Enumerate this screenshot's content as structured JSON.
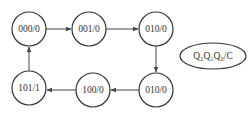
{
  "diagram": {
    "type": "state-transition",
    "states": [
      {
        "id": "s0",
        "label": "000/0",
        "cx": 29,
        "cy": 29
      },
      {
        "id": "s1",
        "label": "001/0",
        "cx": 89,
        "cy": 29
      },
      {
        "id": "s2",
        "label": "010/0",
        "cx": 156,
        "cy": 29
      },
      {
        "id": "s3",
        "label": "010/0",
        "cx": 156,
        "cy": 90
      },
      {
        "id": "s4",
        "label": "100/0",
        "cx": 93,
        "cy": 90
      },
      {
        "id": "s5",
        "label": "101/1",
        "cx": 29,
        "cy": 88
      }
    ],
    "transitions": [
      {
        "from": "000/0",
        "to": "001/0"
      },
      {
        "from": "001/0",
        "to": "010/0"
      },
      {
        "from": "010/0",
        "to": "010/0 (lower)"
      },
      {
        "from": "010/0 (lower)",
        "to": "100/0"
      },
      {
        "from": "100/0",
        "to": "101/1"
      },
      {
        "from": "101/1",
        "to": "000/0"
      }
    ],
    "legend": {
      "label": "Q₂Q₁Q₀/C"
    },
    "colors": {
      "stroke": "#333333",
      "background": "#ffffff"
    }
  }
}
